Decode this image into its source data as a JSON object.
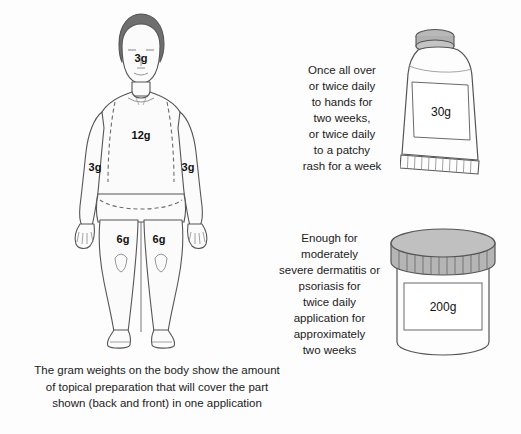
{
  "figure": {
    "body_labels": [
      {
        "region": "head-face",
        "value": "3g"
      },
      {
        "region": "torso-front-back",
        "value": "12g"
      },
      {
        "region": "arm-right",
        "value": "3g"
      },
      {
        "region": "arm-left",
        "value": "3g"
      },
      {
        "region": "leg-right",
        "value": "6g"
      },
      {
        "region": "leg-left",
        "value": "6g"
      }
    ],
    "caption_lines": [
      "The gram weights on the body show the amount",
      "of topical preparation that will cover the part",
      "shown (back and front) in one application"
    ]
  },
  "tube": {
    "size_label": "30g",
    "note_lines": [
      "Once all over",
      "or twice daily",
      "to hands for",
      "two weeks,",
      "or twice daily",
      "to a patchy",
      "rash for a week"
    ]
  },
  "jar": {
    "size_label": "200g",
    "note_lines": [
      "Enough for",
      "moderately",
      "severe dermatitis or",
      "psoriasis for",
      "twice daily",
      "application  for",
      "approximately",
      "two weeks"
    ]
  },
  "colors": {
    "background": "#fdfdfd",
    "outline": "#4a4a4a",
    "hair": "#6f6f6f",
    "skin": "#fbfbfb",
    "lid": "#9a9a9a",
    "text": "#1a1a1a"
  }
}
